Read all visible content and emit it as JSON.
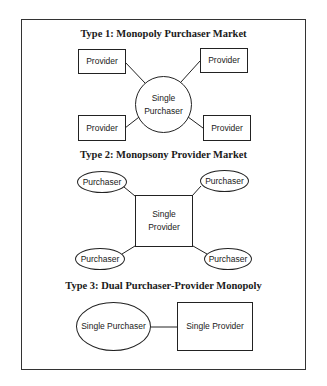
{
  "diagram": {
    "type1": {
      "title": "Type 1: Monopoly Purchaser Market",
      "center": {
        "label_line1": "Single",
        "label_line2": "Purchaser",
        "shape": "circle"
      },
      "satellites": [
        {
          "label": "Provider",
          "shape": "rectangle",
          "position": "top-left"
        },
        {
          "label": "Provider",
          "shape": "rectangle",
          "position": "top-right"
        },
        {
          "label": "Provider",
          "shape": "rectangle",
          "position": "bottom-left"
        },
        {
          "label": "Provider",
          "shape": "rectangle",
          "position": "bottom-right"
        }
      ]
    },
    "type2": {
      "title": "Type 2: Monopsony Provider Market",
      "center": {
        "label_line1": "Single",
        "label_line2": "Provider",
        "shape": "square"
      },
      "satellites": [
        {
          "label": "Purchaser",
          "shape": "ellipse",
          "position": "top-left"
        },
        {
          "label": "Purchaser",
          "shape": "ellipse",
          "position": "top-right"
        },
        {
          "label": "Purchaser",
          "shape": "ellipse",
          "position": "bottom-left"
        },
        {
          "label": "Purchaser",
          "shape": "ellipse",
          "position": "bottom-right"
        }
      ]
    },
    "type3": {
      "title": "Type 3: Dual Purchaser-Provider Monopoly",
      "left": {
        "label": "Single Purchaser",
        "shape": "ellipse"
      },
      "right": {
        "label": "Single Provider",
        "shape": "rectangle"
      }
    }
  }
}
